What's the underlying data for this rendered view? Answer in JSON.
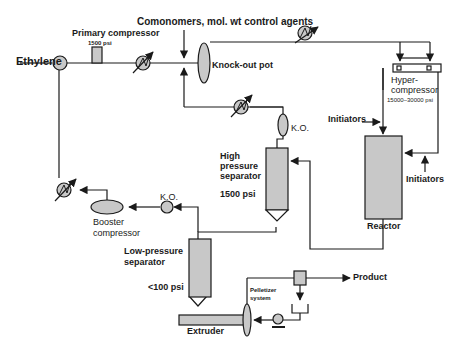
{
  "diagram": {
    "type": "process-flow",
    "title": "Comonomers, mol. wt control agents",
    "colors": {
      "line": "#1a1a1a",
      "fill": "#c8c8c8",
      "background": "#ffffff"
    },
    "labels": {
      "ethylene": "Ethylene",
      "primary_compressor": "Primary compressor",
      "primary_pressure": "1500 psi",
      "comonomers": "Comonomers, mol. wt control agents",
      "knockout_pot": "Knock-out pot",
      "hyper_compressor_1": "Hyper-",
      "hyper_compressor_2": "compressor",
      "hyper_pressure": "15000–30000 psi",
      "initiators_top": "Initiators",
      "initiators_side": "Initiators",
      "reactor": "Reactor",
      "ko_high": "K.O.",
      "high_sep_1": "High",
      "high_sep_2": "pressure",
      "high_sep_3": "separator",
      "high_pressure": "1500 psi",
      "ko_low": "K.O.",
      "booster_1": "Booster",
      "booster_2": "compressor",
      "low_sep_1": "Low-pressure",
      "low_sep_2": "separator",
      "low_pressure": "<100 psi",
      "pelletizer_1": "Pelletizer",
      "pelletizer_2": "system",
      "product": "Product",
      "extruder": "Extruder"
    },
    "nodes": [
      {
        "id": "ethylene-mixer",
        "shape": "circle"
      },
      {
        "id": "primary-compressor",
        "shape": "rect",
        "pressure": "1500 psi"
      },
      {
        "id": "heat-exchanger-1",
        "shape": "exchanger"
      },
      {
        "id": "knockout-pot",
        "shape": "ellipse"
      },
      {
        "id": "heat-exchanger-2",
        "shape": "exchanger"
      },
      {
        "id": "hyper-compressor",
        "shape": "rect",
        "pressure": "15000-30000 psi"
      },
      {
        "id": "reactor",
        "shape": "rect"
      },
      {
        "id": "ko-high",
        "shape": "ellipse"
      },
      {
        "id": "high-pressure-separator",
        "shape": "vessel",
        "pressure": "1500 psi"
      },
      {
        "id": "heat-exchanger-3",
        "shape": "exchanger"
      },
      {
        "id": "heat-exchanger-4",
        "shape": "exchanger"
      },
      {
        "id": "booster-compressor",
        "shape": "ellipse"
      },
      {
        "id": "ko-low",
        "shape": "circle"
      },
      {
        "id": "low-pressure-separator",
        "shape": "vessel",
        "pressure": "<100 psi"
      },
      {
        "id": "extruder",
        "shape": "rect"
      },
      {
        "id": "pelletizer-system",
        "shape": "system"
      }
    ]
  }
}
